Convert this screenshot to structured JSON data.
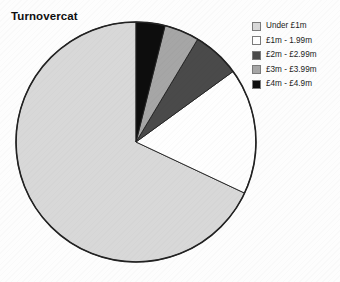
{
  "chart": {
    "title": "Turnovercat"
  },
  "legend": {
    "items": [
      {
        "label": "Under £1m",
        "swatch": "light-gray-swatch",
        "color": "#d8d8d8"
      },
      {
        "label": "£1m - 1.99m",
        "swatch": "white-swatch",
        "color": "#fefefe"
      },
      {
        "label": "£2m - £2.99m",
        "swatch": "dark-gray-swatch",
        "color": "#4a4a4a"
      },
      {
        "label": "£3m - £3.99m",
        "swatch": "medium-gray-swatch",
        "color": "#a6a6a6"
      },
      {
        "label": "£4m - £4.9m",
        "swatch": "black-swatch",
        "color": "#0d0d0d"
      }
    ]
  },
  "chart_data": {
    "type": "pie",
    "title": "Turnovercat",
    "xlabel": "",
    "ylabel": "",
    "legend_position": "right",
    "grid": false,
    "start_angle_deg": 90,
    "direction": "counterclockwise",
    "categories": [
      "Under £1m",
      "£1m - 1.99m",
      "£2m - £2.99m",
      "£3m - £3.99m",
      "£4m - £4.9m"
    ],
    "values": [
      68.0,
      17.0,
      6.4,
      4.7,
      3.9
    ],
    "unit": "percent",
    "colors": [
      "#d8d8d8",
      "#fefefe",
      "#4a4a4a",
      "#a6a6a6",
      "#0d0d0d"
    ],
    "slice_edge_color": "#222222",
    "geometry": {
      "center_x": 136,
      "center_y": 142,
      "radius": 120
    },
    "slices": [
      {
        "label": "Under £1m",
        "value": 68.0,
        "color": "#d8d8d8",
        "start_deg": 90,
        "end_deg": 335.2
      },
      {
        "label": "£1m - 1.99m",
        "value": 17.0,
        "color": "#fefefe",
        "start_deg": 335.2,
        "end_deg": 36.0
      },
      {
        "label": "£2m - £2.99m",
        "value": 6.4,
        "color": "#4a4a4a",
        "start_deg": 36.0,
        "end_deg": 59.0
      },
      {
        "label": "£3m - £3.99m",
        "value": 4.7,
        "color": "#a6a6a6",
        "start_deg": 59.0,
        "end_deg": 76.0
      },
      {
        "label": "£4m - £4.9m",
        "value": 3.9,
        "color": "#0d0d0d",
        "start_deg": 76.0,
        "end_deg": 90.0
      }
    ]
  }
}
